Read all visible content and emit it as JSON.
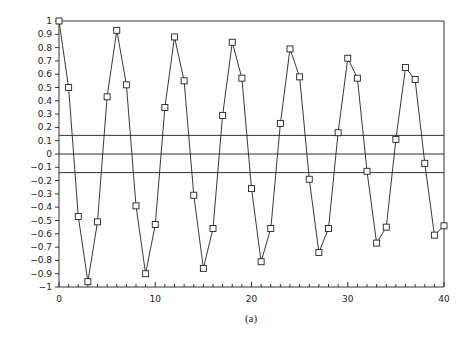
{
  "caption": "(a)",
  "chart_data": {
    "type": "line",
    "title": "",
    "xlabel": "",
    "ylabel": "",
    "xlim": [
      0,
      40
    ],
    "ylim": [
      -1,
      1
    ],
    "grid": false,
    "marker": "square",
    "x_ticks": [
      "0",
      "10",
      "20",
      "30",
      "40"
    ],
    "y_ticks": [
      "1",
      "0.9",
      "0.8",
      "0.7",
      "0.6",
      "0.5",
      "0.4",
      "0.3",
      "0.2",
      "0.1",
      "0",
      "-0.1",
      "-0.2",
      "-0.3",
      "-0.4",
      "-0.5",
      "-0.6",
      "-0.7",
      "-0.8",
      "-0.9",
      "-1"
    ],
    "series": [
      {
        "name": "autocorrelation",
        "x": [
          0,
          1,
          2,
          3,
          4,
          5,
          6,
          7,
          8,
          9,
          10,
          11,
          12,
          13,
          14,
          15,
          16,
          17,
          18,
          19,
          20,
          21,
          22,
          23,
          24,
          25,
          26,
          27,
          28,
          29,
          30,
          31,
          32,
          33,
          34,
          35,
          36,
          37,
          38,
          39,
          40
        ],
        "values": [
          1.0,
          0.5,
          -0.47,
          -0.96,
          -0.51,
          0.43,
          0.93,
          0.52,
          -0.39,
          -0.9,
          -0.53,
          0.35,
          0.88,
          0.55,
          -0.31,
          -0.86,
          -0.56,
          0.29,
          0.84,
          0.57,
          -0.26,
          -0.81,
          -0.56,
          0.23,
          0.79,
          0.58,
          -0.19,
          -0.74,
          -0.56,
          0.16,
          0.72,
          0.57,
          -0.13,
          -0.67,
          -0.55,
          0.11,
          0.65,
          0.56,
          -0.07,
          -0.61,
          -0.54
        ]
      }
    ],
    "reference_lines": [
      {
        "y": 0.14,
        "label": "upper confidence bound"
      },
      {
        "y": 0,
        "label": "zero line"
      },
      {
        "y": -0.14,
        "label": "lower confidence bound"
      }
    ]
  }
}
